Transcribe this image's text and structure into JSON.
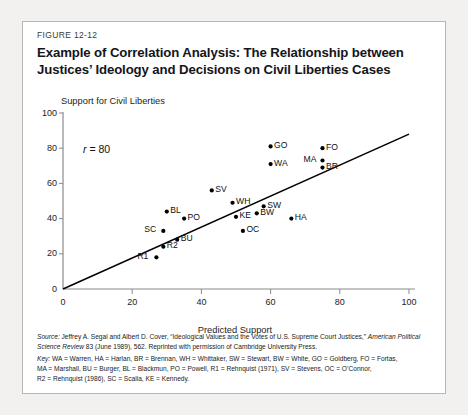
{
  "figure": {
    "number": "FIGURE 12-12",
    "title": "Example of Correlation Analysis: The Relationship between Justices’ Ideology and Decisions on Civil Liberties Cases"
  },
  "annotation": {
    "r_symbol": "r",
    "r_rest": " = 80"
  },
  "notes": {
    "source_label": "Source:",
    "source_text_1": " Jeffrey A. Segal and Albert D. Cover, “Ideological Values and the Votes of U.S. Supreme Court Justices,” ",
    "source_italic_2": "American Political Science Review",
    "source_text_3": " 83 (June 1989), 562. Reprinted with permission of Cambridge University Press.",
    "key_label": "Key:",
    "key_line_1": " WA = Warren, HA = Harlan, BR = Brennan, WH = Whittaker, SW = Stewart, BW = White, GO = Goldberg, FO = Fortas,",
    "key_line_2": "MA = Marshall, BU = Burger, BL = Blackmun, PO = Powell, R1 = Rehnquist (1971), SV = Stevens, OC = O’Connor,",
    "key_line_3": "R2 = Rehnquist (1986), SC = Scalia, KE = Kennedy."
  },
  "chart_data": {
    "type": "scatter",
    "title": "Example of Correlation Analysis: The Relationship between Justices’ Ideology and Decisions on Civil Liberties Cases",
    "xlabel": "Predicted Support",
    "ylabel": "Support for Civil Liberties",
    "xlim": [
      0,
      100
    ],
    "ylim": [
      0,
      100
    ],
    "xticks": [
      0,
      20,
      40,
      60,
      80,
      100
    ],
    "yticks": [
      0,
      20,
      40,
      60,
      80,
      100
    ],
    "grid": false,
    "legend": false,
    "correlation_label": "r = 80",
    "correlation": 0.8,
    "trendline": {
      "x": [
        0,
        100
      ],
      "y": [
        0,
        88
      ],
      "color": "#000000"
    },
    "point_color": "#000000",
    "points": [
      {
        "code": "SC",
        "name": "Scalia",
        "x": 29,
        "y": 33,
        "label_side": "left"
      },
      {
        "code": "BL",
        "name": "Blackmun",
        "x": 30,
        "y": 44,
        "label_side": "right"
      },
      {
        "code": "PO",
        "name": "Powell",
        "x": 35,
        "y": 40,
        "label_side": "right"
      },
      {
        "code": "BU",
        "name": "Burger",
        "x": 33,
        "y": 28,
        "label_side": "right"
      },
      {
        "code": "R2",
        "name": "Rehnquist (1986)",
        "x": 29,
        "y": 24,
        "label_side": "right"
      },
      {
        "code": "R1",
        "name": "Rehnquist (1971)",
        "x": 27,
        "y": 18,
        "label_side": "left"
      },
      {
        "code": "SV",
        "name": "Stevens",
        "x": 43,
        "y": 56,
        "label_side": "right"
      },
      {
        "code": "WH",
        "name": "Whittaker",
        "x": 49,
        "y": 49,
        "label_side": "right"
      },
      {
        "code": "KE",
        "name": "Kennedy",
        "x": 50,
        "y": 41,
        "label_side": "right"
      },
      {
        "code": "BW",
        "name": "White",
        "x": 56,
        "y": 43,
        "label_side": "right"
      },
      {
        "code": "OC",
        "name": "O’Connor",
        "x": 52,
        "y": 33,
        "label_side": "right"
      },
      {
        "code": "SW",
        "name": "Stewart",
        "x": 58,
        "y": 47,
        "label_side": "right"
      },
      {
        "code": "HA",
        "name": "Harlan",
        "x": 66,
        "y": 40,
        "label_side": "right"
      },
      {
        "code": "GO",
        "name": "Goldberg",
        "x": 60,
        "y": 81,
        "label_side": "right"
      },
      {
        "code": "WA",
        "name": "Warren",
        "x": 60,
        "y": 71,
        "label_side": "right"
      },
      {
        "code": "FO",
        "name": "Fortas",
        "x": 75,
        "y": 80,
        "label_side": "right"
      },
      {
        "code": "MA",
        "name": "Marshall",
        "x": 75,
        "y": 73,
        "label_side": "left"
      },
      {
        "code": "BR",
        "name": "Brennan",
        "x": 75,
        "y": 69,
        "label_side": "right"
      }
    ]
  }
}
